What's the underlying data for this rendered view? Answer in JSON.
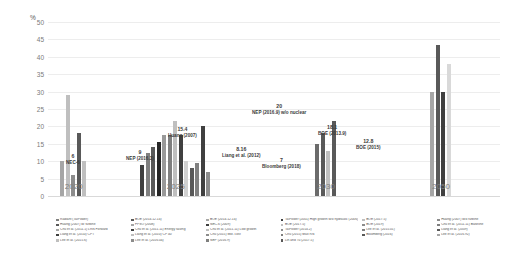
{
  "chart_data": {
    "type": "bar",
    "title": "",
    "xlabel": "",
    "ylabel": "%",
    "ylim": [
      0,
      50
    ],
    "ytick_labels": [
      "50",
      "45",
      "40",
      "35",
      "30",
      "25",
      "20",
      "15",
      "10",
      "5",
      "0"
    ],
    "grid": true,
    "legend_position": "bottom",
    "categories": [
      "2020",
      "2025",
      "2030",
      "2050"
    ],
    "groups": [
      {
        "category": "2020",
        "values": [
          10.0,
          29.0,
          6.0,
          18.0,
          10.0
        ],
        "colors": [
          "#a6a6a6",
          "#bfbfbf",
          "#8c8c8c",
          "#595959",
          "#bfbfbf"
        ]
      },
      {
        "category": "2025",
        "values": [
          9.0,
          12.5,
          14.0,
          15.4,
          17.5,
          17.5,
          21.5,
          17.5,
          10.0,
          8.16,
          9.5,
          20.0,
          7.0
        ],
        "colors": [
          "#404040",
          "#808080",
          "#595959",
          "#262626",
          "#999999",
          "#7f7f7f",
          "#bfbfbf",
          "#404040",
          "#d0d0d0",
          "#595959",
          "#808080",
          "#404040",
          "#8c8c8c"
        ]
      },
      {
        "category": "2030",
        "values": [
          15.0,
          18.1,
          12.8,
          21.5
        ],
        "colors": [
          "#6b6b6b",
          "#595959",
          "#c0c0c0",
          "#595959"
        ]
      },
      {
        "category": "2050",
        "values": [
          30.0,
          43.5,
          30.0,
          38.0
        ],
        "colors": [
          "#a6a6a6",
          "#595959",
          "#404040",
          "#d9d9d9"
        ]
      }
    ],
    "annotations": [
      {
        "value": "6",
        "source": "NEC-6",
        "group": "2020"
      },
      {
        "value": "9",
        "source": "NEP (2016.3)",
        "group": "2025"
      },
      {
        "value": "15.4",
        "source": "Huang (2007)",
        "group": "2025"
      },
      {
        "value": "8.16",
        "source": "Liang et al. (2012)",
        "group": "2025"
      },
      {
        "value": "20",
        "source": "NEP (2016.9) w/o nuclear",
        "group": "2025"
      },
      {
        "value": "7",
        "source": "Bloomberg (2018)",
        "group": "2025"
      },
      {
        "value": "18.1",
        "source": "BOE (2013.9)",
        "group": "2030"
      },
      {
        "value": "12.8",
        "source": "BOE (2015)",
        "group": "2030"
      }
    ],
    "legend_columns": [
      [
        "Radiant (TaiPower)",
        "Huang (2007) w/ turbine",
        "Chu et al. (2011.1) LRN Forward",
        "Liang et al. (2010) CPT",
        "Lee et al. (2015.6)"
      ],
      [
        "BOE (2014.12.14)",
        "FPSO (2008)",
        "Chu et al. (2011.11) Energy saving",
        "Liang et al. (2010) CP 40",
        "Lee et al. (2016.04)"
      ],
      [
        "BOE (2014.12.14)",
        "NEC-6 (2009)",
        "Chu et al. (2011.11) Low growth",
        "Chu (2015) Mkt. cost",
        "NEP (2016.9)"
      ],
      [
        "TaiPower (2001) High growth w/o hydraulic (2006)",
        "BOE (2017.5)",
        "TaiPower (2014.2)",
        "Chu (2015) Max RN",
        "Lin and Tu (2017.5)"
      ],
      [
        "BOE (2017.5)",
        "BOE (2019)",
        "Lee et al. (2015.01)",
        "Bloomberg (2016)"
      ],
      [
        "Huang (2007) w/o turbine",
        "Chu et al. (2011.11) Baseline",
        "Liang et al. (2009)",
        "Lee et al. (2016.92)"
      ]
    ]
  }
}
